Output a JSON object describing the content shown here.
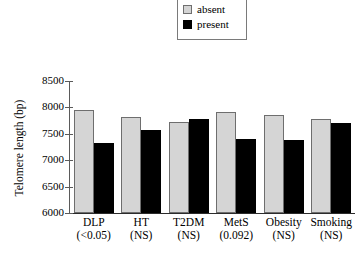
{
  "legend": {
    "items": [
      {
        "label": "absent",
        "swatch": "light-gray-square",
        "color": "#d4d4d4"
      },
      {
        "label": "present",
        "swatch": "black-square",
        "color": "#000000"
      }
    ]
  },
  "chart_data": {
    "type": "bar",
    "title": "",
    "xlabel": "",
    "ylabel": "Telomere length (bp)",
    "ylim": [
      6000,
      8500
    ],
    "yticks": [
      6000,
      6500,
      7000,
      7500,
      8000,
      8500
    ],
    "ytick_labels": [
      "6000",
      "6500",
      "7000",
      "7500",
      "8000",
      "8500"
    ],
    "grid": false,
    "legend_position": "top-center",
    "categories": [
      "DLP",
      "HT",
      "T2DM",
      "MetS",
      "Obesity",
      "Smoking"
    ],
    "category_pvalues": [
      "(<0.05)",
      "(NS)",
      "(NS)",
      "(0.092)",
      "(NS)",
      "(NS)"
    ],
    "series": [
      {
        "name": "absent",
        "color": "#d4d4d4",
        "values": [
          7960,
          7810,
          7720,
          7910,
          7850,
          7775
        ]
      },
      {
        "name": "present",
        "color": "#000000",
        "values": [
          7330,
          7570,
          7780,
          7405,
          7380,
          7700
        ]
      }
    ]
  }
}
